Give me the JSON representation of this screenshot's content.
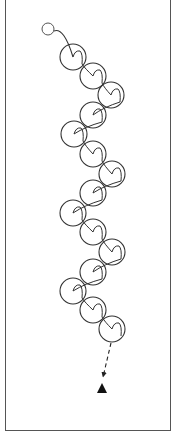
{
  "diagram": {
    "type": "drill-diagram",
    "colors": {
      "stroke": "#333333",
      "frame": "#555555",
      "background": "#ffffff",
      "cone": "#111111"
    },
    "start_marker": {
      "icon": "player-start-circle-icon",
      "cx": 48,
      "cy": 29,
      "r": 6
    },
    "loops": [
      {
        "cx": 73,
        "cy": 57,
        "side": "left"
      },
      {
        "cx": 93,
        "cy": 76,
        "side": "center"
      },
      {
        "cx": 111,
        "cy": 95,
        "side": "right"
      },
      {
        "cx": 93,
        "cy": 115,
        "side": "center"
      },
      {
        "cx": 74,
        "cy": 134,
        "side": "left"
      },
      {
        "cx": 93,
        "cy": 154,
        "side": "center"
      },
      {
        "cx": 112,
        "cy": 174,
        "side": "right"
      },
      {
        "cx": 93,
        "cy": 193,
        "side": "center"
      },
      {
        "cx": 73,
        "cy": 213,
        "side": "left"
      },
      {
        "cx": 93,
        "cy": 232,
        "side": "center"
      },
      {
        "cx": 112,
        "cy": 252,
        "side": "right"
      },
      {
        "cx": 93,
        "cy": 272,
        "side": "center"
      },
      {
        "cx": 73,
        "cy": 291,
        "side": "left"
      },
      {
        "cx": 93,
        "cy": 310,
        "side": "center"
      },
      {
        "cx": 112,
        "cy": 329,
        "side": "right"
      }
    ],
    "loop_radius": 13,
    "dashed_run": {
      "x1": 111,
      "y1": 343,
      "x2": 103,
      "y2": 377
    },
    "end_marker": {
      "icon": "cone-triangle-icon",
      "apex_x": 102,
      "apex_y": 383,
      "base_y": 393,
      "half_width": 5
    }
  }
}
